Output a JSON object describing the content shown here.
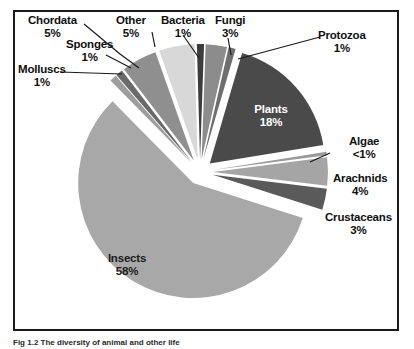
{
  "figure": {
    "caption": "Fig 1.2  The diversity of animal and other life",
    "frame_color": "#1b1b1b",
    "background": "#ffffff"
  },
  "chart_data": {
    "type": "pie",
    "title": "",
    "exploded": true,
    "legend": "none",
    "labels_inside": [
      "Plants",
      "Insects"
    ],
    "categories": [
      "Fungi",
      "Protozoa",
      "Plants",
      "Algae",
      "Arachnids",
      "Crustaceans",
      "Insects",
      "Molluscs",
      "Sponges",
      "Chordata",
      "Other",
      "Bacteria"
    ],
    "values": [
      3,
      1,
      18,
      0.5,
      4,
      3,
      58,
      1,
      1,
      5,
      5,
      1
    ],
    "value_labels": [
      "3%",
      "1%",
      "18%",
      "<1%",
      "4%",
      "3%",
      "58%",
      "1%",
      "1%",
      "5%",
      "5%",
      "1%"
    ],
    "colors": [
      "#8c8c8c",
      "#6e6e6e",
      "#4a4a4a",
      "#9a9a9a",
      "#a5a5a5",
      "#5a5a5a",
      "#a8a8a8",
      "#9d9d9d",
      "#6a6a6a",
      "#8f8f8f",
      "#d8d8d8",
      "#3c3c3c"
    ],
    "slices": [
      {
        "name": "Fungi",
        "value": 3,
        "label": "Fungi",
        "pct": "3%",
        "color": "#8c8c8c"
      },
      {
        "name": "Protozoa",
        "value": 1,
        "label": "Protozoa",
        "pct": "1%",
        "color": "#6e6e6e"
      },
      {
        "name": "Plants",
        "value": 18,
        "label": "Plants",
        "pct": "18%",
        "color": "#4a4a4a"
      },
      {
        "name": "Algae",
        "value": 0.5,
        "label": "Algae",
        "pct": "<1%",
        "color": "#9a9a9a"
      },
      {
        "name": "Arachnids",
        "value": 4,
        "label": "Arachnids",
        "pct": "4%",
        "color": "#a5a5a5"
      },
      {
        "name": "Crustaceans",
        "value": 3,
        "label": "Crustaceans",
        "pct": "3%",
        "color": "#5a5a5a"
      },
      {
        "name": "Insects",
        "value": 58,
        "label": "Insects",
        "pct": "58%",
        "color": "#a8a8a8"
      },
      {
        "name": "Molluscs",
        "value": 1,
        "label": "Molluscs",
        "pct": "1%",
        "color": "#9d9d9d"
      },
      {
        "name": "Sponges",
        "value": 1,
        "label": "Sponges",
        "pct": "1%",
        "color": "#6a6a6a"
      },
      {
        "name": "Chordata",
        "value": 5,
        "label": "Chordata",
        "pct": "5%",
        "color": "#8f8f8f"
      },
      {
        "name": "Other",
        "value": 5,
        "label": "Other",
        "pct": "5%",
        "color": "#d8d8d8"
      },
      {
        "name": "Bacteria",
        "value": 1,
        "label": "Bacteria",
        "pct": "1%",
        "color": "#3c3c3c"
      }
    ]
  }
}
